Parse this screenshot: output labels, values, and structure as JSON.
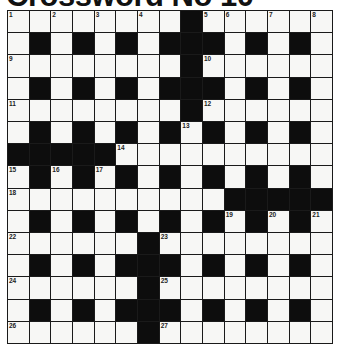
{
  "title": "Crossword No 10",
  "grid": {
    "rows": 15,
    "cols": 15,
    "colors": {
      "white": "#f7f7f5",
      "black": "#0d0d0d",
      "line": "#1a1a1a"
    },
    "layout": [
      "........#......",
      ".#.#.#.###.#.#.",
      "........#......",
      ".#.#.#.###.#.#.",
      "........#......",
      ".#.#.#.#.#.#.#.",
      "#####..........",
      ".#.#.#.#.#.#.#.",
      "..........#####",
      ".#.#.#.#.#.#.#.",
      "......#........",
      ".#.#.###.#.#.#.",
      "......#........",
      ".#.#.###.#.#.#.",
      "......#........"
    ],
    "numbers": [
      {
        "row": 0,
        "col": 0,
        "n": "1"
      },
      {
        "row": 0,
        "col": 2,
        "n": "2"
      },
      {
        "row": 0,
        "col": 4,
        "n": "3"
      },
      {
        "row": 0,
        "col": 6,
        "n": "4"
      },
      {
        "row": 0,
        "col": 9,
        "n": "5"
      },
      {
        "row": 0,
        "col": 10,
        "n": "6"
      },
      {
        "row": 0,
        "col": 12,
        "n": "7"
      },
      {
        "row": 0,
        "col": 14,
        "n": "8"
      },
      {
        "row": 2,
        "col": 0,
        "n": "9"
      },
      {
        "row": 2,
        "col": 9,
        "n": "10"
      },
      {
        "row": 4,
        "col": 0,
        "n": "11"
      },
      {
        "row": 4,
        "col": 9,
        "n": "12"
      },
      {
        "row": 5,
        "col": 8,
        "n": "13"
      },
      {
        "row": 6,
        "col": 5,
        "n": "14"
      },
      {
        "row": 7,
        "col": 0,
        "n": "15"
      },
      {
        "row": 7,
        "col": 2,
        "n": "16"
      },
      {
        "row": 7,
        "col": 4,
        "n": "17"
      },
      {
        "row": 8,
        "col": 0,
        "n": "18"
      },
      {
        "row": 9,
        "col": 10,
        "n": "19"
      },
      {
        "row": 9,
        "col": 12,
        "n": "20"
      },
      {
        "row": 9,
        "col": 14,
        "n": "21"
      },
      {
        "row": 10,
        "col": 0,
        "n": "22"
      },
      {
        "row": 10,
        "col": 7,
        "n": "23"
      },
      {
        "row": 12,
        "col": 0,
        "n": "24"
      },
      {
        "row": 12,
        "col": 7,
        "n": "25"
      },
      {
        "row": 14,
        "col": 0,
        "n": "26"
      },
      {
        "row": 14,
        "col": 7,
        "n": "27"
      }
    ]
  }
}
